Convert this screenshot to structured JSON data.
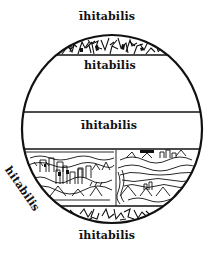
{
  "diagram": {
    "type": "climatic-zones-map",
    "style": "woodcut",
    "colors": {
      "ink": "#111111",
      "paper": "#ffffff"
    },
    "zones": [
      {
        "id": "north-frigid",
        "fill": "hatched-foliage"
      },
      {
        "id": "north-temperate",
        "fill": "blank"
      },
      {
        "id": "torrid",
        "fill": "blank"
      },
      {
        "id": "south-temperate",
        "fill": "landscape-illustration",
        "divided": true
      },
      {
        "id": "south-frigid",
        "fill": "hatched-foliage"
      }
    ],
    "labels": {
      "top": "īhitabilis",
      "upper_temperate": "hitabilis",
      "middle": "īhitabilis",
      "left_lower": "hitabilis",
      "bottom": "īhitabilis"
    }
  }
}
